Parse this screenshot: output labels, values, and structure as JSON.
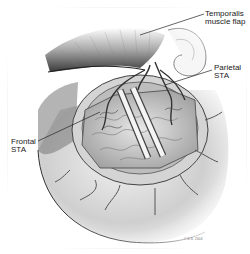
{
  "figure": {
    "type": "surgical-illustration",
    "labels": [
      {
        "id": "temporalis",
        "lines": [
          "Temporalis",
          "muscle flap"
        ]
      },
      {
        "id": "parietal",
        "lines": [
          "Parietal",
          "STA"
        ]
      },
      {
        "id": "frontal",
        "lines": [
          "Frontal",
          "STA"
        ]
      }
    ],
    "signature": "© D.S. 2004",
    "colors": {
      "background": "#ffffff",
      "line": "#333333",
      "shade_dark": "#555555",
      "shade_mid": "#9a9a9a",
      "shade_light": "#d8d8d8"
    }
  }
}
